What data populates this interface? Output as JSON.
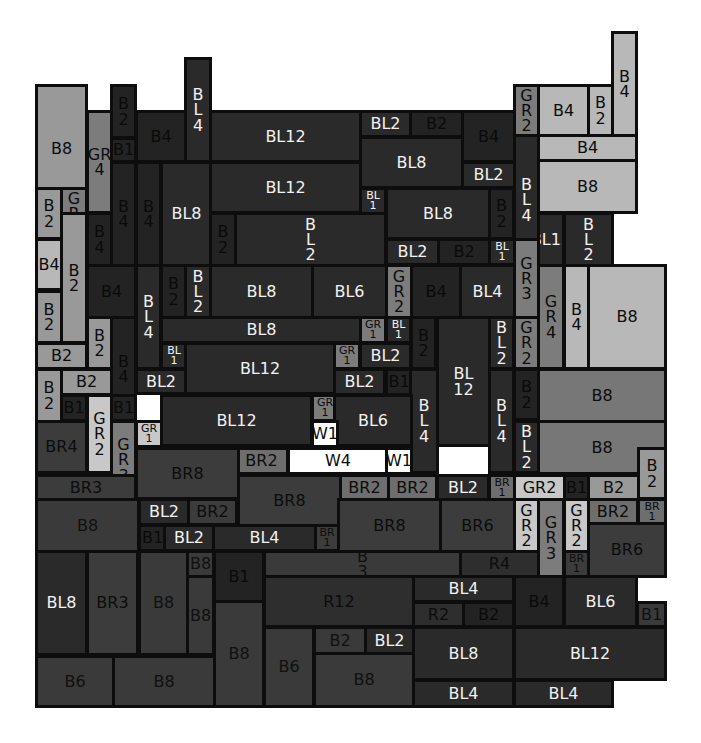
{
  "diagram": {
    "title": "",
    "palette": {
      "B": {
        "fill": "#3a3a3a",
        "text": "#101010"
      },
      "Bd": {
        "fill": "#2c2c2c",
        "text": "#0c0c0c"
      },
      "Bk": {
        "fill": "#232323",
        "text": "#0a0a0a"
      },
      "Bm": {
        "fill": "#777777",
        "text": "#0c0c0c"
      },
      "Bl": {
        "fill": "#b8b8b8",
        "text": "#0c0c0c"
      },
      "Bp": {
        "fill": "#999999",
        "text": "#0c0c0c"
      },
      "BL": {
        "fill": "#2a2a2a",
        "text": "#f2f2f2"
      },
      "GR": {
        "fill": "#7c7c7c",
        "text": "#0c0c0c"
      },
      "GRl": {
        "fill": "#c8c8c8",
        "text": "#0c0c0c"
      },
      "BR": {
        "fill": "#3c3c3c",
        "text": "#0c0c0c"
      },
      "BRm": {
        "fill": "#6e6e6e",
        "text": "#0c0c0c"
      },
      "R": {
        "fill": "#2e2e2e",
        "text": "#0c0c0c"
      },
      "W": {
        "fill": "#ffffff",
        "text": "#0c0c0c"
      }
    },
    "blocks": [
      {
        "label": "B8",
        "tone": "Bp"
      },
      {
        "label": "GR\n4",
        "tone": "GR"
      },
      {
        "label": "B\n2",
        "tone": "Bk"
      },
      {
        "label": "B1",
        "tone": "Bk"
      },
      {
        "label": "B4",
        "tone": "Bk"
      },
      {
        "label": "B\nL\n4",
        "tone": "BL"
      },
      {
        "label": "BL12",
        "tone": "BL"
      },
      {
        "label": "BL2",
        "tone": "BL"
      },
      {
        "label": "B2",
        "tone": "Bk"
      },
      {
        "label": "B4",
        "tone": "Bk"
      },
      {
        "label": "G\nR\n2",
        "tone": "GR"
      },
      {
        "label": "B4",
        "tone": "Bl"
      },
      {
        "label": "B\n2",
        "tone": "Bl"
      },
      {
        "label": "B\n4",
        "tone": "Bl"
      },
      {
        "label": "B4",
        "tone": "Bl"
      },
      {
        "label": "B8",
        "tone": "Bl"
      },
      {
        "label": "BL8",
        "tone": "BL"
      },
      {
        "label": "BL2",
        "tone": "BL"
      },
      {
        "label": "B\nL\n4",
        "tone": "BL"
      },
      {
        "label": "B\n2",
        "tone": "Bp"
      },
      {
        "label": "G\nR\n2",
        "tone": "GR"
      },
      {
        "label": "B\n4",
        "tone": "Bk"
      },
      {
        "label": "B\n4",
        "tone": "Bk"
      },
      {
        "label": "BL8",
        "tone": "BL"
      },
      {
        "label": "BL12",
        "tone": "BL"
      },
      {
        "label": "BL\n1",
        "tone": "BL"
      },
      {
        "label": "BL8",
        "tone": "BL"
      },
      {
        "label": "B\n2",
        "tone": "Bk"
      },
      {
        "label": "B\n2",
        "tone": "Bk"
      },
      {
        "label": "B\nL\n2",
        "tone": "BL"
      },
      {
        "label": "BL12",
        "tone": "BL"
      },
      {
        "label": "B\nL\n2",
        "tone": "BL"
      },
      {
        "label": "B4",
        "tone": "Bl"
      },
      {
        "label": "B\n2",
        "tone": "Bp"
      },
      {
        "label": "B\n4",
        "tone": "Bk"
      },
      {
        "label": "BL2",
        "tone": "BL"
      },
      {
        "label": "B2",
        "tone": "Bk"
      },
      {
        "label": "BL\n1",
        "tone": "BL"
      },
      {
        "label": "G\nR\n3",
        "tone": "GR"
      },
      {
        "label": "B4",
        "tone": "Bk"
      },
      {
        "label": "B\nL\n4",
        "tone": "BL"
      },
      {
        "label": "B\n2",
        "tone": "Bk"
      },
      {
        "label": "B\nL\n2",
        "tone": "BL"
      },
      {
        "label": "BL8",
        "tone": "BL"
      },
      {
        "label": "BL6",
        "tone": "BL"
      },
      {
        "label": "G\nR\n2",
        "tone": "GR"
      },
      {
        "label": "B4",
        "tone": "Bk"
      },
      {
        "label": "BL4",
        "tone": "BL"
      },
      {
        "label": "G\nR\n4",
        "tone": "GR"
      },
      {
        "label": "B\n4",
        "tone": "Bl"
      },
      {
        "label": "B8",
        "tone": "Bl"
      },
      {
        "label": "B\n2",
        "tone": "Bp"
      },
      {
        "label": "B\n2",
        "tone": "Bp"
      },
      {
        "label": "BL8",
        "tone": "BL"
      },
      {
        "label": "GR\n1",
        "tone": "GR"
      },
      {
        "label": "BL\n1",
        "tone": "BL"
      },
      {
        "label": "B\n2",
        "tone": "Bk"
      },
      {
        "label": "B\nL\n2",
        "tone": "BL"
      },
      {
        "label": "G\nR\n2",
        "tone": "GR"
      },
      {
        "label": "B2",
        "tone": "Bp"
      },
      {
        "label": "B\n4",
        "tone": "Bk"
      },
      {
        "label": "BL\n1",
        "tone": "BL"
      },
      {
        "label": "BL12",
        "tone": "BL"
      },
      {
        "label": "GR\n1",
        "tone": "GR"
      },
      {
        "label": "BL2",
        "tone": "BL"
      },
      {
        "label": "BL\n12",
        "tone": "BL"
      },
      {
        "label": "B\n2",
        "tone": "Bp"
      },
      {
        "label": "B2",
        "tone": "Bp"
      },
      {
        "label": "BL2",
        "tone": "BL"
      },
      {
        "label": "BL2",
        "tone": "BL"
      },
      {
        "label": "B1",
        "tone": "Bk"
      },
      {
        "label": "B\nL\n4",
        "tone": "BL"
      },
      {
        "label": "B\nL\n4",
        "tone": "BL"
      },
      {
        "label": "B\n2",
        "tone": "Bk"
      },
      {
        "label": "B8",
        "tone": "Bm"
      },
      {
        "label": "B1",
        "tone": "Bk"
      },
      {
        "label": "G\nR\n2",
        "tone": "GRl"
      },
      {
        "label": "B1",
        "tone": "Bk"
      },
      {
        "label": "BL12",
        "tone": "BL"
      },
      {
        "label": "GR\n1",
        "tone": "GR"
      },
      {
        "label": "BL6",
        "tone": "BL"
      },
      {
        "label": "B\nL\n2",
        "tone": "BL"
      },
      {
        "label": "B8",
        "tone": "Bm"
      },
      {
        "label": "BR4",
        "tone": "BR"
      },
      {
        "label": "G\nR\n3",
        "tone": "GR"
      },
      {
        "label": "GR\n1",
        "tone": "GRl"
      },
      {
        "label": "W1",
        "tone": "W"
      },
      {
        "label": "BR2",
        "tone": "BRm"
      },
      {
        "label": "W4",
        "tone": "W"
      },
      {
        "label": "W1",
        "tone": "W"
      },
      {
        "label": "B\n2",
        "tone": "Bp"
      },
      {
        "label": "BR3",
        "tone": "BR"
      },
      {
        "label": "BR8",
        "tone": "BR"
      },
      {
        "label": "BR8",
        "tone": "BR"
      },
      {
        "label": "BR2",
        "tone": "BRm"
      },
      {
        "label": "BR2",
        "tone": "BRm"
      },
      {
        "label": "BL2",
        "tone": "BL"
      },
      {
        "label": "BR\n1",
        "tone": "BRm"
      },
      {
        "label": "GR2",
        "tone": "GRl"
      },
      {
        "label": "B1",
        "tone": "Bk"
      },
      {
        "label": "B2",
        "tone": "Bp"
      },
      {
        "label": "B8",
        "tone": "B"
      },
      {
        "label": "BL2",
        "tone": "BL"
      },
      {
        "label": "BR2",
        "tone": "BR"
      },
      {
        "label": "BR8",
        "tone": "BR"
      },
      {
        "label": "BR6",
        "tone": "BR"
      },
      {
        "label": "G\nR\n2",
        "tone": "GRl"
      },
      {
        "label": "G\nR\n3",
        "tone": "GR"
      },
      {
        "label": "G\nR\n2",
        "tone": "GRl"
      },
      {
        "label": "BR2",
        "tone": "BRm"
      },
      {
        "label": "BR\n1",
        "tone": "BRm"
      },
      {
        "label": "B1",
        "tone": "Bk"
      },
      {
        "label": "BL2",
        "tone": "BL"
      },
      {
        "label": "BL4",
        "tone": "BL"
      },
      {
        "label": "BR\n1",
        "tone": "BR"
      },
      {
        "label": "BR6",
        "tone": "BR"
      },
      {
        "label": "BR\n1",
        "tone": "BR"
      },
      {
        "label": "BL8",
        "tone": "BL"
      },
      {
        "label": "BR3",
        "tone": "BR"
      },
      {
        "label": "B8",
        "tone": "B"
      },
      {
        "label": "B8",
        "tone": "B"
      },
      {
        "label": "B8",
        "tone": "B"
      },
      {
        "label": "B1",
        "tone": "Bk"
      },
      {
        "label": "B\n3",
        "tone": "B"
      },
      {
        "label": "R4",
        "tone": "R"
      },
      {
        "label": "R12",
        "tone": "R"
      },
      {
        "label": "BL4",
        "tone": "BL"
      },
      {
        "label": "R2",
        "tone": "R"
      },
      {
        "label": "B2",
        "tone": "Bk"
      },
      {
        "label": "B4",
        "tone": "Bk"
      },
      {
        "label": "BL6",
        "tone": "BL"
      },
      {
        "label": "B1",
        "tone": "B"
      },
      {
        "label": "B8",
        "tone": "B"
      },
      {
        "label": "B6",
        "tone": "B"
      },
      {
        "label": "B2",
        "tone": "B"
      },
      {
        "label": "BL2",
        "tone": "BL"
      },
      {
        "label": "B8",
        "tone": "B"
      },
      {
        "label": "BL8",
        "tone": "BL"
      },
      {
        "label": "BL12",
        "tone": "BL"
      },
      {
        "label": "B6",
        "tone": "B"
      },
      {
        "label": "B8",
        "tone": "B"
      },
      {
        "label": "BL4",
        "tone": "BL"
      },
      {
        "label": "BL4",
        "tone": "BL"
      }
    ]
  }
}
